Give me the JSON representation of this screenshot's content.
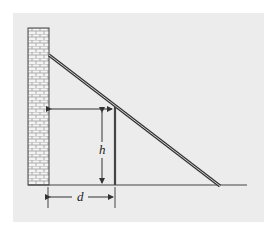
{
  "figure": {
    "colors": {
      "background": "#ffffff",
      "panel": "#ececec",
      "line": "#333333",
      "brick_fill": "#f4f4f4",
      "brick_mortar": "#9a9a9a"
    },
    "labels": {
      "height": "h",
      "distance": "d"
    },
    "elements": {
      "wall": "brick-wall",
      "ladder": "ladder",
      "post": "vertical-post",
      "ground": "ground-line"
    }
  }
}
